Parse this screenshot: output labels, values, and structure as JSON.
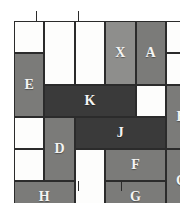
{
  "figure": {
    "kind": "polyomino-tiling-grid",
    "columns": 5,
    "rows": 5,
    "cell_width": 30.4,
    "cell_height": 32.0
  },
  "colors": {
    "white": "#fdfdfc",
    "gray": "#7b7b79",
    "light_gray": "#8e8e8c",
    "dark_gray": "#3a3a3a",
    "line": "#2b2b2b",
    "label_text": "#f4f4f2",
    "background": "#ffffff"
  },
  "pieces": [
    {
      "label": "",
      "name": "cell-r0c0-blank",
      "fill": "white",
      "col": 0,
      "row": 0,
      "w": 1,
      "h": 1
    },
    {
      "label": "",
      "name": "cell-r0c1-blank",
      "fill": "white",
      "col": 1,
      "row": 0,
      "w": 1,
      "h": 2
    },
    {
      "label": "",
      "name": "cell-r0c2-blank",
      "fill": "white",
      "col": 2,
      "row": 0,
      "w": 1,
      "h": 2
    },
    {
      "label": "X",
      "name": "piece-x",
      "fill": "light_gray",
      "col": 3,
      "row": 0,
      "w": 1,
      "h": 2
    },
    {
      "label": "A",
      "name": "piece-a",
      "fill": "gray",
      "col": 4,
      "row": 0,
      "w": 1,
      "h": 2
    },
    {
      "label": "",
      "name": "cell-r0c5-blank",
      "fill": "white",
      "col": 5,
      "row": 0,
      "w": 1,
      "h": 1
    },
    {
      "label": "E",
      "name": "piece-e",
      "fill": "gray",
      "col": 0,
      "row": 1,
      "w": 1,
      "h": 2
    },
    {
      "label": "",
      "name": "cell-r1c5-blank",
      "fill": "white",
      "col": 5,
      "row": 1,
      "w": 1,
      "h": 1
    },
    {
      "label": "K",
      "name": "piece-k",
      "fill": "dark_gray",
      "col": 1,
      "row": 2,
      "w": 3,
      "h": 1
    },
    {
      "label": "",
      "name": "cell-r2c4-blank",
      "fill": "white",
      "col": 4,
      "row": 2,
      "w": 1,
      "h": 1
    },
    {
      "label": "B",
      "name": "piece-b",
      "fill": "gray",
      "col": 5,
      "row": 2,
      "w": 1,
      "h": 2
    },
    {
      "label": "",
      "name": "cell-r3c0-blank",
      "fill": "white",
      "col": 0,
      "row": 3,
      "w": 1,
      "h": 1
    },
    {
      "label": "D",
      "name": "piece-d",
      "fill": "gray",
      "col": 1,
      "row": 3,
      "w": 1,
      "h": 2
    },
    {
      "label": "J",
      "name": "piece-j",
      "fill": "dark_gray",
      "col": 2,
      "row": 3,
      "w": 3,
      "h": 1
    },
    {
      "label": "",
      "name": "cell-r4c0-blank",
      "fill": "white",
      "col": 0,
      "row": 4,
      "w": 1,
      "h": 1
    },
    {
      "label": "",
      "name": "cell-r4c2-blank",
      "fill": "white",
      "col": 2,
      "row": 4,
      "w": 1,
      "h": 2
    },
    {
      "label": "F",
      "name": "piece-f",
      "fill": "gray",
      "col": 3,
      "row": 4,
      "w": 2,
      "h": 1
    },
    {
      "label": "C",
      "name": "piece-c",
      "fill": "gray",
      "col": 5,
      "row": 4,
      "w": 1,
      "h": 2
    },
    {
      "label": "H",
      "name": "piece-h",
      "fill": "gray",
      "col": 0,
      "row": 5,
      "w": 2,
      "h": 1
    },
    {
      "label": "G",
      "name": "piece-g",
      "fill": "gray",
      "col": 3,
      "row": 5,
      "w": 2,
      "h": 1
    }
  ],
  "ticks": {
    "top": [
      0.72,
      2.12
    ],
    "bottom": [
      2.12,
      3.52
    ]
  }
}
